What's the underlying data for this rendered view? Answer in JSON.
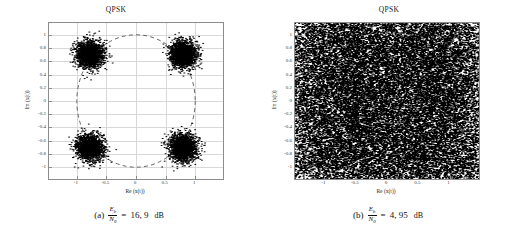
{
  "figure": {
    "panels": [
      {
        "id": "panel-a",
        "title": "QPSK",
        "xlabel": "Re (x(t))",
        "ylabel": "Im (x(t))",
        "caption": {
          "tag": "(a)",
          "numerator": "E",
          "numerator_sub": "b",
          "denominator": "N",
          "denominator_sub": "0",
          "equals": "=",
          "value": "16, 9",
          "unit": "dB"
        }
      },
      {
        "id": "panel-b",
        "title": "QPSK",
        "xlabel": "Re (x(t))",
        "ylabel": "Im (x(t))",
        "caption": {
          "tag": "(b)",
          "numerator": "E",
          "numerator_sub": "b",
          "denominator": "N",
          "denominator_sub": "0",
          "equals": "=",
          "value": "4, 95",
          "unit": "dB"
        }
      }
    ]
  },
  "chart_data": [
    {
      "type": "scatter",
      "id": "panel-a",
      "title": "QPSK",
      "xlabel": "Re (x(t))",
      "ylabel": "Im (x(t))",
      "xlim": [
        -1.32,
        1.32
      ],
      "ylim": [
        -1.18,
        1.18
      ],
      "xticks": [
        -1,
        -0.5,
        0,
        0.5,
        1
      ],
      "xticklabels": [
        "-1",
        "-0.5",
        "0",
        "0.5",
        "1"
      ],
      "yticks": [
        1,
        0.8,
        0.6,
        0.4,
        0.2,
        0,
        -0.2,
        -0.4,
        -0.6,
        -0.8,
        -1
      ],
      "yticklabels": [
        "1",
        "0.8",
        "0.6",
        "0.4",
        "0.2",
        "0",
        "-0.2",
        "-0.4",
        "-0.6",
        "-0.8",
        "-1"
      ],
      "grid": true,
      "legend": null,
      "marker_color": "#000000",
      "annotation": "dashed unit circle of radius 1 centred at origin",
      "clusters": [
        {
          "label": "symbol 00",
          "center": [
            0.707,
            0.707
          ],
          "sigma": 0.1,
          "n_points": 2000
        },
        {
          "label": "symbol 01",
          "center": [
            -0.707,
            0.707
          ],
          "sigma": 0.1,
          "n_points": 2000
        },
        {
          "label": "symbol 11",
          "center": [
            -0.707,
            -0.707
          ],
          "sigma": 0.1,
          "n_points": 2000
        },
        {
          "label": "symbol 10",
          "center": [
            0.707,
            -0.707
          ],
          "sigma": 0.1,
          "n_points": 2000
        }
      ],
      "ebn0_db": 16.9,
      "description": "Four tight Gaussian constellation clouds at the QPSK symbol points; clusters are well separated and sit on the unit circle."
    },
    {
      "type": "scatter",
      "id": "panel-b",
      "title": "QPSK",
      "xlabel": "Re (x(t))",
      "ylabel": "Im (x(t))",
      "xlim": [
        -1.32,
        1.32
      ],
      "ylim": [
        -1.18,
        1.18
      ],
      "xticks": [
        -1,
        -0.5,
        0,
        0.5,
        1
      ],
      "xticklabels": [
        "-1",
        "-0.5",
        "0",
        "0.5",
        "1"
      ],
      "yticks": [
        1,
        0.8,
        0.6,
        0.4,
        0.2,
        0,
        -0.2,
        -0.4,
        -0.6,
        -0.8,
        -1
      ],
      "yticklabels": [
        "1",
        "0.8",
        "0.6",
        "0.4",
        "0.2",
        "0",
        "-0.2",
        "-0.4",
        "-0.6",
        "-0.8",
        "-1"
      ],
      "grid": true,
      "legend": null,
      "marker_color": "#000000",
      "annotation": "no visible unit circle; plane saturated with points",
      "clusters": [
        {
          "label": "symbol 00",
          "center": [
            0.707,
            0.707
          ],
          "sigma": 0.62,
          "n_points": 9000
        },
        {
          "label": "symbol 01",
          "center": [
            -0.707,
            0.707
          ],
          "sigma": 0.62,
          "n_points": 9000
        },
        {
          "label": "symbol 11",
          "center": [
            -0.707,
            -0.707
          ],
          "sigma": 0.62,
          "n_points": 9000
        },
        {
          "label": "symbol 10",
          "center": [
            0.707,
            -0.707
          ],
          "sigma": 0.62,
          "n_points": 9000
        }
      ],
      "ebn0_db": 4.95,
      "description": "Noise dominates; the four clouds merge into a nearly uniform dense black field covering the whole axes box."
    }
  ]
}
